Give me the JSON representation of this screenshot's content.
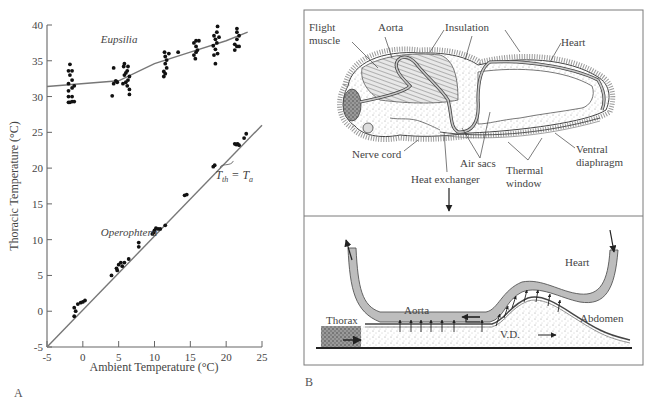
{
  "figure": {
    "panel_a_label": "A",
    "panel_b_label": "B"
  },
  "chart_data": {
    "type": "scatter",
    "xlabel": "Ambient Temperature (°C)",
    "ylabel": "Thoracic Temperature (°C)",
    "xlim": [
      -5,
      25
    ],
    "ylim": [
      -5,
      40
    ],
    "xticks": [
      -5,
      0,
      5,
      10,
      15,
      20,
      25
    ],
    "yticks": [
      -5,
      0,
      5,
      10,
      15,
      20,
      25,
      30,
      35,
      40
    ],
    "grid": false,
    "legend": null,
    "annotations": [
      {
        "text": "Eupsilia",
        "x": 2.5,
        "y": 37.5,
        "style": "italic"
      },
      {
        "text": "Operophtera",
        "x": 2.5,
        "y": 10.5,
        "style": "italic"
      },
      {
        "text": "T_th = T_a",
        "x": 18.5,
        "y": 18.5,
        "style": "italic",
        "points_to": [
          21,
          21
        ]
      }
    ],
    "series": [
      {
        "name": "Eupsilia",
        "kind": "scatter+fit",
        "fit_line": [
          [
            -5,
            31.4
          ],
          [
            5,
            32.2
          ],
          [
            10,
            34.6
          ],
          [
            15,
            36.2
          ],
          [
            20,
            37.8
          ],
          [
            23,
            39.0
          ]
        ],
        "points": [
          [
            -2,
            29.2
          ],
          [
            -1.8,
            29.2
          ],
          [
            -1.5,
            29.3
          ],
          [
            -1.2,
            29.3
          ],
          [
            -2,
            30.0
          ],
          [
            -1.5,
            30.0
          ],
          [
            -2,
            30.8
          ],
          [
            -1.5,
            31.2
          ],
          [
            -1.2,
            31.5
          ],
          [
            -2,
            31.8
          ],
          [
            -1.5,
            32.3
          ],
          [
            -1.8,
            33.0
          ],
          [
            -2,
            33.6
          ],
          [
            -1.5,
            33.6
          ],
          [
            -1.8,
            34.5
          ],
          [
            4.1,
            30.1
          ],
          [
            4.3,
            31.8
          ],
          [
            4.8,
            32.0
          ],
          [
            4.6,
            32.2
          ],
          [
            4.3,
            34.0
          ],
          [
            5.6,
            31.8
          ],
          [
            6.0,
            32.0
          ],
          [
            6.3,
            32.3
          ],
          [
            5.8,
            33.0
          ],
          [
            6.5,
            32.8
          ],
          [
            6.2,
            33.6
          ],
          [
            5.7,
            34.2
          ],
          [
            6.3,
            34.2
          ],
          [
            6.5,
            31.0
          ],
          [
            6.5,
            30.3
          ],
          [
            6.2,
            31.5
          ],
          [
            6.0,
            33.3
          ],
          [
            5.8,
            34.6
          ],
          [
            11.3,
            32.8
          ],
          [
            11.5,
            33.2
          ],
          [
            11.3,
            33.5
          ],
          [
            11.7,
            34.0
          ],
          [
            11.5,
            34.6
          ],
          [
            11.7,
            35.1
          ],
          [
            11.5,
            35.6
          ],
          [
            11.4,
            36.2
          ],
          [
            12.0,
            36.0
          ],
          [
            13.3,
            36.2
          ],
          [
            15.7,
            35.3
          ],
          [
            15.5,
            35.8
          ],
          [
            15.8,
            36.2
          ],
          [
            16.0,
            36.5
          ],
          [
            15.8,
            37.0
          ],
          [
            15.5,
            37.5
          ],
          [
            16.2,
            37.8
          ],
          [
            15.8,
            37.8
          ],
          [
            18.5,
            34.6
          ],
          [
            18.3,
            35.8
          ],
          [
            18.8,
            36.0
          ],
          [
            18.5,
            36.6
          ],
          [
            18.2,
            37.1
          ],
          [
            18.7,
            37.5
          ],
          [
            18.5,
            38.0
          ],
          [
            19.0,
            38.3
          ],
          [
            18.3,
            38.5
          ],
          [
            18.7,
            39.0
          ],
          [
            18.8,
            39.8
          ],
          [
            21.2,
            36.5
          ],
          [
            21.5,
            37.0
          ],
          [
            21.8,
            37.0
          ],
          [
            21.2,
            37.3
          ],
          [
            21.5,
            38.0
          ],
          [
            21.8,
            38.5
          ],
          [
            21.5,
            39.0
          ],
          [
            21.5,
            39.5
          ]
        ]
      },
      {
        "name": "Operophtera",
        "kind": "scatter+line",
        "line": [
          [
            -5,
            -5
          ],
          [
            25,
            26
          ]
        ],
        "line_label": "T_th = T_a",
        "points": [
          [
            -1.2,
            -0.7
          ],
          [
            -1.2,
            0.5
          ],
          [
            -1.0,
            0.0
          ],
          [
            -0.7,
            1.0
          ],
          [
            -0.3,
            1.2
          ],
          [
            0.0,
            1.3
          ],
          [
            0.3,
            1.5
          ],
          [
            4.0,
            5.0
          ],
          [
            4.7,
            6.0
          ],
          [
            4.8,
            5.7
          ],
          [
            5.0,
            6.5
          ],
          [
            5.3,
            6.8
          ],
          [
            5.5,
            6.3
          ],
          [
            5.8,
            6.8
          ],
          [
            6.4,
            7.3
          ],
          [
            7.8,
            9.0
          ],
          [
            7.8,
            9.6
          ],
          [
            9.7,
            10.8
          ],
          [
            9.9,
            11.0
          ],
          [
            10.0,
            11.3
          ],
          [
            10.2,
            11.6
          ],
          [
            10.5,
            11.5
          ],
          [
            10.8,
            11.5
          ],
          [
            11.5,
            12.0
          ],
          [
            14.2,
            16.2
          ],
          [
            14.5,
            16.3
          ],
          [
            18.2,
            20.2
          ],
          [
            18.4,
            20.4
          ],
          [
            21.2,
            23.4
          ],
          [
            21.4,
            23.3
          ],
          [
            21.6,
            23.4
          ],
          [
            21.8,
            23.2
          ],
          [
            22.5,
            24.2
          ],
          [
            22.8,
            24.8
          ]
        ]
      }
    ]
  },
  "diagram": {
    "top_labels": {
      "flight_muscle_1": "Flight",
      "flight_muscle_2": "muscle",
      "aorta": "Aorta",
      "insulation": "Insulation",
      "heart": "Heart",
      "nerve_cord": "Nerve cord",
      "air_sacs": "Air sacs",
      "heat_exchanger": "Heat exchanger",
      "thermal_window_1": "Thermal",
      "thermal_window_2": "window",
      "ventral_diaphragm_1": "Ventral",
      "ventral_diaphragm_2": "diaphragm"
    },
    "bottom_labels": {
      "heart": "Heart",
      "aorta": "Aorta",
      "thorax": "Thorax",
      "abdomen": "Abdomen",
      "vd": "V.D."
    },
    "colors": {
      "vessel_fill": "#bdbdbd",
      "vessel_stroke": "#555555",
      "stipple": "#8a8a8a",
      "thorax_dark": "#6e6e6e",
      "frame": "#7a7a7a"
    }
  }
}
